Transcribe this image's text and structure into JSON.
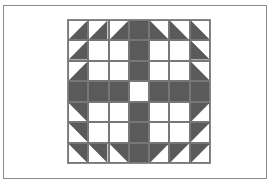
{
  "figure": {
    "title": "",
    "grid_size": 7,
    "colors": {
      "dark": "#5a5a5a",
      "light": "#ffffff",
      "line": "#777777",
      "frame": "#8a8a8a"
    },
    "legend": {
      "W": "white square",
      "D": "dark square",
      "BR": "half-square triangle, dark lower-right",
      "BL": "half-square triangle, dark lower-left",
      "TR": "half-square triangle, dark upper-right",
      "TL": "half-square triangle, dark upper-left"
    },
    "rows": [
      [
        "BR",
        "BR",
        "BR",
        "D",
        "BL",
        "BL",
        "BL"
      ],
      [
        "BR",
        "W",
        "W",
        "D",
        "W",
        "W",
        "BL"
      ],
      [
        "BR",
        "W",
        "W",
        "D",
        "W",
        "W",
        "BL"
      ],
      [
        "D",
        "D",
        "D",
        "W",
        "D",
        "D",
        "D"
      ],
      [
        "TR",
        "W",
        "W",
        "D",
        "W",
        "W",
        "TL"
      ],
      [
        "TR",
        "W",
        "W",
        "D",
        "W",
        "W",
        "TL"
      ],
      [
        "TR",
        "TR",
        "TR",
        "D",
        "TL",
        "TL",
        "TL"
      ]
    ]
  }
}
